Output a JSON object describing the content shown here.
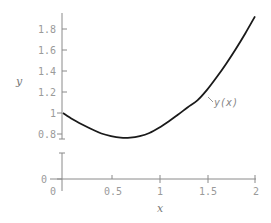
{
  "chart_data": {
    "type": "line",
    "title": "",
    "xlabel": "x",
    "ylabel": "y",
    "xlim": [
      0,
      2
    ],
    "ylim": [
      0,
      1.9
    ],
    "y_axis_break": [
      0.75,
      0.05
    ],
    "grid": false,
    "x_ticks": [
      "0",
      "0.5",
      "1",
      "1.5",
      "2"
    ],
    "y_ticks": [
      "0",
      "0.8",
      "1",
      "1.2",
      "1.4",
      "1.6",
      "1.8"
    ],
    "annotations": [
      {
        "text": "y(x)",
        "x": 1.55,
        "y": 1.05
      }
    ],
    "series": [
      {
        "name": "y(x)",
        "x": [
          0,
          0.1,
          0.2,
          0.3,
          0.4,
          0.5,
          0.6,
          0.7,
          0.8,
          0.9,
          1.0,
          1.1,
          1.2,
          1.3,
          1.4,
          1.5,
          1.6,
          1.7,
          1.8,
          1.9,
          2.0
        ],
        "values": [
          1.0,
          0.94,
          0.89,
          0.845,
          0.805,
          0.78,
          0.765,
          0.765,
          0.78,
          0.81,
          0.86,
          0.92,
          0.985,
          1.055,
          1.12,
          1.22,
          1.34,
          1.47,
          1.61,
          1.76,
          1.92
        ]
      }
    ]
  },
  "labels": {
    "x_axis": "x",
    "y_axis": "y",
    "curve": "y(x)",
    "x_ticks": [
      "0",
      "0.5",
      "1",
      "1.5",
      "2"
    ],
    "y_ticks_upper": [
      "1.8",
      "1.6",
      "1.4",
      "1.2",
      "1",
      "0.8"
    ],
    "y_tick_zero": "0"
  }
}
